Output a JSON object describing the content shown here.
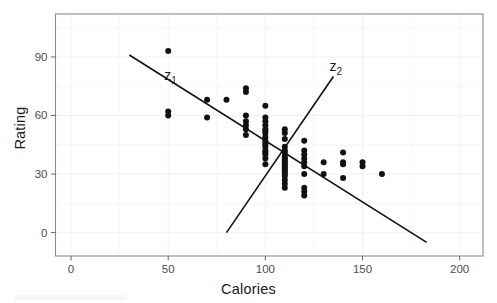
{
  "chart_data": {
    "type": "scatter",
    "title": "",
    "xlabel": "Calories",
    "ylabel": "Rating",
    "xlim": [
      -8,
      212
    ],
    "ylim": [
      -12,
      112
    ],
    "xticks": [
      0,
      50,
      100,
      150,
      200
    ],
    "yticks": [
      0,
      30,
      60,
      90
    ],
    "grid": true,
    "grid_color": "#f2f2f2",
    "panel_border_color": "#8c8c8c",
    "point_color": "#111111",
    "point_radius": 3.0,
    "legend": "none",
    "annotations": [
      {
        "name": "z1",
        "text": "z",
        "subscript": "1",
        "x": 48,
        "y": 78
      },
      {
        "name": "z2",
        "text": "z",
        "subscript": "2",
        "x": 133,
        "y": 83
      }
    ],
    "lines": [
      {
        "name": "z1-axis-line",
        "label": "z1",
        "x": [
          30,
          183
        ],
        "y": [
          91,
          -5
        ],
        "color": "#111111",
        "width": 1.6
      },
      {
        "name": "z2-axis-line",
        "label": "z2",
        "x": [
          80,
          135
        ],
        "y": [
          0,
          80
        ],
        "color": "#111111",
        "width": 1.6
      }
    ],
    "points": [
      {
        "x": 50,
        "y": 93
      },
      {
        "x": 50,
        "y": 62
      },
      {
        "x": 50,
        "y": 60
      },
      {
        "x": 70,
        "y": 68
      },
      {
        "x": 70,
        "y": 59
      },
      {
        "x": 80,
        "y": 68
      },
      {
        "x": 90,
        "y": 74
      },
      {
        "x": 90,
        "y": 72
      },
      {
        "x": 90,
        "y": 60
      },
      {
        "x": 90,
        "y": 57
      },
      {
        "x": 90,
        "y": 55
      },
      {
        "x": 90,
        "y": 53
      },
      {
        "x": 90,
        "y": 50
      },
      {
        "x": 100,
        "y": 65
      },
      {
        "x": 100,
        "y": 59
      },
      {
        "x": 100,
        "y": 57
      },
      {
        "x": 100,
        "y": 55
      },
      {
        "x": 100,
        "y": 53
      },
      {
        "x": 100,
        "y": 52
      },
      {
        "x": 100,
        "y": 51
      },
      {
        "x": 100,
        "y": 49
      },
      {
        "x": 100,
        "y": 47
      },
      {
        "x": 100,
        "y": 46
      },
      {
        "x": 100,
        "y": 45
      },
      {
        "x": 100,
        "y": 44
      },
      {
        "x": 100,
        "y": 42
      },
      {
        "x": 100,
        "y": 41
      },
      {
        "x": 100,
        "y": 40
      },
      {
        "x": 100,
        "y": 38
      },
      {
        "x": 100,
        "y": 35
      },
      {
        "x": 110,
        "y": 53
      },
      {
        "x": 110,
        "y": 51
      },
      {
        "x": 110,
        "y": 48
      },
      {
        "x": 110,
        "y": 44
      },
      {
        "x": 110,
        "y": 42
      },
      {
        "x": 110,
        "y": 41
      },
      {
        "x": 110,
        "y": 39
      },
      {
        "x": 110,
        "y": 38
      },
      {
        "x": 110,
        "y": 37
      },
      {
        "x": 110,
        "y": 36
      },
      {
        "x": 110,
        "y": 35
      },
      {
        "x": 110,
        "y": 34
      },
      {
        "x": 110,
        "y": 33
      },
      {
        "x": 110,
        "y": 32
      },
      {
        "x": 110,
        "y": 31
      },
      {
        "x": 110,
        "y": 30
      },
      {
        "x": 110,
        "y": 29
      },
      {
        "x": 110,
        "y": 27
      },
      {
        "x": 110,
        "y": 25
      },
      {
        "x": 110,
        "y": 23
      },
      {
        "x": 120,
        "y": 47
      },
      {
        "x": 120,
        "y": 42
      },
      {
        "x": 120,
        "y": 40
      },
      {
        "x": 120,
        "y": 38
      },
      {
        "x": 120,
        "y": 36
      },
      {
        "x": 120,
        "y": 34
      },
      {
        "x": 120,
        "y": 30
      },
      {
        "x": 120,
        "y": 23
      },
      {
        "x": 120,
        "y": 21
      },
      {
        "x": 120,
        "y": 19
      },
      {
        "x": 130,
        "y": 36
      },
      {
        "x": 130,
        "y": 30
      },
      {
        "x": 140,
        "y": 41
      },
      {
        "x": 140,
        "y": 36
      },
      {
        "x": 140,
        "y": 35
      },
      {
        "x": 140,
        "y": 28
      },
      {
        "x": 150,
        "y": 36
      },
      {
        "x": 150,
        "y": 34
      },
      {
        "x": 160,
        "y": 30
      }
    ]
  }
}
